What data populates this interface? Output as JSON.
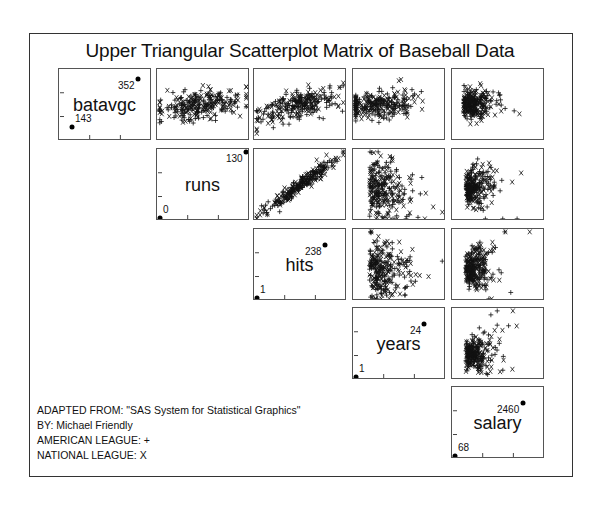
{
  "title": "Upper Triangular Scatterplot Matrix of Baseball Data",
  "notes": [
    "ADAPTED FROM: \"SAS System for Statistical Graphics\"",
    "BY: Michael Friendly",
    "AMERICAN LEAGUE: +",
    "NATIONAL LEAGUE: X"
  ],
  "chart_data": {
    "type": "scatter",
    "subtype": "upper-triangular scatterplot matrix",
    "title": "Upper Triangular Scatterplot Matrix of Baseball Data",
    "variables": [
      {
        "name": "batavgc",
        "min": 143,
        "max": 352
      },
      {
        "name": "runs",
        "min": 0,
        "max": 130
      },
      {
        "name": "hits",
        "min": 1,
        "max": 238
      },
      {
        "name": "years",
        "min": 1,
        "max": 24
      },
      {
        "name": "salary",
        "min": 68,
        "max": 2460
      }
    ],
    "legend": [
      {
        "label": "AMERICAN LEAGUE",
        "marker": "+"
      },
      {
        "label": "NATIONAL LEAGUE",
        "marker": "X"
      }
    ],
    "panels": [
      {
        "row": 0,
        "col": 1,
        "x": "runs",
        "y": "batavgc",
        "pattern": "weak-positive",
        "cx": 0.45,
        "cy": 0.5,
        "sx": 0.22,
        "sy": 0.1,
        "slope": 0.15
      },
      {
        "row": 0,
        "col": 2,
        "x": "hits",
        "y": "batavgc",
        "pattern": "positive",
        "cx": 0.45,
        "cy": 0.5,
        "sx": 0.22,
        "sy": 0.1,
        "slope": 0.3
      },
      {
        "row": 0,
        "col": 3,
        "x": "years",
        "y": "batavgc",
        "pattern": "flat",
        "cx": 0.25,
        "cy": 0.5,
        "sx": 0.2,
        "sy": 0.1,
        "slope": 0.05
      },
      {
        "row": 0,
        "col": 4,
        "x": "salary",
        "y": "batavgc",
        "pattern": "right-skewed",
        "cx": 0.18,
        "cy": 0.5,
        "sx": 0.14,
        "sy": 0.1,
        "slope": 0.1
      },
      {
        "row": 1,
        "col": 2,
        "x": "hits",
        "y": "runs",
        "pattern": "strong-positive",
        "cx": 0.5,
        "cy": 0.5,
        "sx": 0.2,
        "sy": 0.05,
        "slope": 0.9
      },
      {
        "row": 1,
        "col": 3,
        "x": "years",
        "y": "runs",
        "pattern": "decreasing-spread",
        "cx": 0.25,
        "cy": 0.45,
        "sx": 0.18,
        "sy": 0.22,
        "slope": -0.1
      },
      {
        "row": 1,
        "col": 4,
        "x": "salary",
        "y": "runs",
        "pattern": "fan",
        "cx": 0.2,
        "cy": 0.45,
        "sx": 0.13,
        "sy": 0.2,
        "slope": 0.3
      },
      {
        "row": 2,
        "col": 3,
        "x": "years",
        "y": "hits",
        "pattern": "decreasing-spread",
        "cx": 0.25,
        "cy": 0.45,
        "sx": 0.18,
        "sy": 0.2,
        "slope": -0.1
      },
      {
        "row": 2,
        "col": 4,
        "x": "salary",
        "y": "hits",
        "pattern": "fan",
        "cx": 0.2,
        "cy": 0.45,
        "sx": 0.13,
        "sy": 0.2,
        "slope": 0.3
      },
      {
        "row": 3,
        "col": 4,
        "x": "salary",
        "y": "years",
        "pattern": "fan",
        "cx": 0.2,
        "cy": 0.35,
        "sx": 0.13,
        "sy": 0.18,
        "slope": 0.4
      }
    ],
    "points_per_panel": 263,
    "grid": false
  },
  "layout": {
    "cols": [
      58,
      156,
      253,
      352,
      451
    ],
    "rows": [
      68,
      148,
      228,
      307,
      386
    ],
    "width": 93,
    "height": 72
  }
}
